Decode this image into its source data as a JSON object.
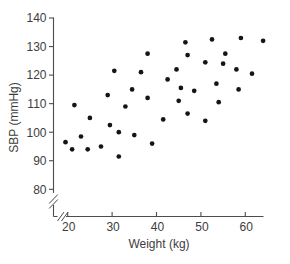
{
  "chart_data": {
    "type": "scatter",
    "title": "",
    "xlabel": "Weight (kg)",
    "ylabel": "SBP (mmHg)",
    "x_ticks": [
      20,
      30,
      40,
      50,
      60
    ],
    "y_ticks": [
      80,
      90,
      100,
      110,
      120,
      130,
      140
    ],
    "xlim": [
      20,
      66
    ],
    "ylim": [
      80,
      140
    ],
    "axis_break_x": true,
    "axis_break_y": true,
    "grid": false,
    "legend": "none",
    "marker": {
      "shape": "circle",
      "color": "#151515",
      "radius_px": 2.35
    },
    "axis_color": "#4d4d4d",
    "text_color": "#3d3d3d",
    "background": "#ffffff",
    "points": [
      [
        21.5,
        109.5
      ],
      [
        19.5,
        96.5
      ],
      [
        21,
        94
      ],
      [
        23,
        98.5
      ],
      [
        24.5,
        94
      ],
      [
        25,
        105
      ],
      [
        27.5,
        95
      ],
      [
        29,
        113
      ],
      [
        29.5,
        102.5
      ],
      [
        30.5,
        121.5
      ],
      [
        31.5,
        100
      ],
      [
        31.5,
        91.5
      ],
      [
        33,
        109
      ],
      [
        34.5,
        115
      ],
      [
        35,
        99
      ],
      [
        36.5,
        121
      ],
      [
        38,
        127.5
      ],
      [
        38,
        112
      ],
      [
        39,
        96
      ],
      [
        41.5,
        104.5
      ],
      [
        42.5,
        118.5
      ],
      [
        44.5,
        122
      ],
      [
        45,
        111
      ],
      [
        45.5,
        115.5
      ],
      [
        46.5,
        131.5
      ],
      [
        47,
        127
      ],
      [
        47,
        106.5
      ],
      [
        48.5,
        114.5
      ],
      [
        51,
        124.5
      ],
      [
        51,
        104
      ],
      [
        52.5,
        132.5
      ],
      [
        53.5,
        117
      ],
      [
        54,
        110.5
      ],
      [
        55,
        124
      ],
      [
        55.5,
        127.5
      ],
      [
        58,
        122
      ],
      [
        58.5,
        115
      ],
      [
        59,
        133
      ],
      [
        61.5,
        120.5
      ],
      [
        64,
        132
      ]
    ]
  }
}
